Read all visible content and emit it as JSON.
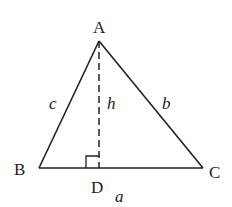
{
  "diagram": {
    "type": "triangle-with-altitude",
    "vertices": {
      "A": {
        "label": "A",
        "x": 99,
        "y": 41
      },
      "B": {
        "label": "B",
        "x": 39,
        "y": 168
      },
      "C": {
        "label": "C",
        "x": 203,
        "y": 168
      },
      "D": {
        "label": "D",
        "x": 99,
        "y": 168
      }
    },
    "sides": {
      "a": {
        "label": "a"
      },
      "b": {
        "label": "b"
      },
      "c": {
        "label": "c"
      }
    },
    "altitude": {
      "label": "h",
      "style": "dashed"
    },
    "right_angle_marker": true,
    "colors": {
      "stroke": "#222222",
      "background": "#ffffff"
    }
  }
}
